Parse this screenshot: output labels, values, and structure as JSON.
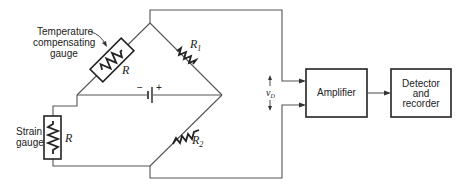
{
  "diagram": {
    "labels": {
      "temp_gauge_line1": "Temperature",
      "temp_gauge_line2": "compensating",
      "temp_gauge_line3": "gauge",
      "temp_gauge_R": "R",
      "strain_gauge_line1": "Strain",
      "strain_gauge_line2": "gauge",
      "strain_gauge_R": "R",
      "r1": "R",
      "r1_sub": "1",
      "r2": "R",
      "r2_sub": "2",
      "battery_minus": "−",
      "battery_plus": "+",
      "output_voltage": "v",
      "output_voltage_sub": "D"
    },
    "blocks": [
      {
        "id": "amplifier",
        "label": "Amplifier"
      },
      {
        "id": "detector",
        "line1": "Detector",
        "line2": "and",
        "line3": "recorder"
      }
    ]
  }
}
